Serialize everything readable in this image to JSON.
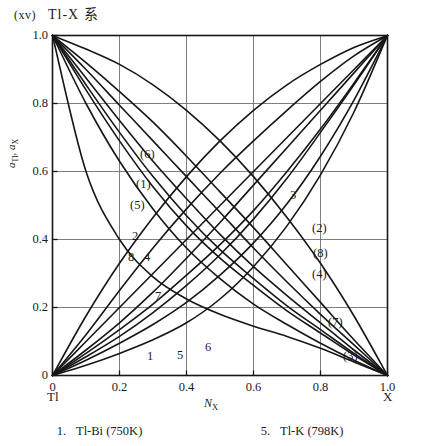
{
  "title": {
    "roman_numeral": "(xv)",
    "system": "Tl-X 系"
  },
  "axes": {
    "ylabel_main": "a",
    "ylabel_sub1": "Tl",
    "ylabel_sep": ", ",
    "ylabel_main2": "a",
    "ylabel_sub2": "X",
    "xlabel_main": "N",
    "xlabel_sub": "X",
    "endpoint_left": "Tl",
    "endpoint_right": "X",
    "ytick_labels": [
      "1.0",
      "0.8",
      "0.6",
      "0.4",
      "0.2",
      "0"
    ],
    "xtick_labels": [
      "0",
      "0.2",
      "0.4",
      "0.6",
      "0.8",
      "1.0"
    ]
  },
  "curve_labels": [
    {
      "text": "(6)",
      "x": 140,
      "y": 148
    },
    {
      "text": "(1)",
      "x": 136,
      "y": 178
    },
    {
      "text": "(5)",
      "x": 130,
      "y": 199
    },
    {
      "text": "2",
      "x": 132,
      "y": 230
    },
    {
      "text": "8",
      "x": 128,
      "y": 251
    },
    {
      "text": "4",
      "x": 144,
      "y": 251
    },
    {
      "text": "7",
      "x": 155,
      "y": 290
    },
    {
      "text": "1",
      "x": 147,
      "y": 350
    },
    {
      "text": "5",
      "x": 177,
      "y": 349
    },
    {
      "text": "6",
      "x": 205,
      "y": 341
    },
    {
      "text": "3",
      "x": 290,
      "y": 189
    },
    {
      "text": "(2)",
      "x": 312,
      "y": 222
    },
    {
      "text": "(8)",
      "x": 313,
      "y": 247
    },
    {
      "text": "(4)",
      "x": 312,
      "y": 268
    },
    {
      "text": "(7)",
      "x": 328,
      "y": 316
    },
    {
      "text": "(3)",
      "x": 343,
      "y": 350
    }
  ],
  "legend": [
    {
      "number": "1.",
      "label": "Tl-Bi (750K)"
    },
    {
      "number": "5.",
      "label": "Tl-K (798K)"
    }
  ],
  "colors": {
    "ink": "#1b1b1b",
    "grid": "#6b6b6b",
    "frame": "#1b1b1b",
    "background": "#ffffff"
  },
  "chart_data": {
    "type": "line",
    "title": "(xv) Tl-X 系",
    "xlabel": "N_X",
    "ylabel": "a_Tl, a_X",
    "xlim": [
      0,
      1
    ],
    "ylim": [
      0,
      1
    ],
    "xticks": [
      0,
      0.2,
      0.4,
      0.6,
      0.8,
      1.0
    ],
    "yticks": [
      0,
      0.2,
      0.4,
      0.6,
      0.8,
      1.0
    ],
    "grid": true,
    "legend_position": "below-plot",
    "x": [
      0,
      0.1,
      0.2,
      0.3,
      0.4,
      0.5,
      0.6,
      0.7,
      0.8,
      0.9,
      1.0
    ],
    "series": [
      {
        "name": "1",
        "component": "a_Tl",
        "system": "Tl-Bi (750K)",
        "values": [
          1.0,
          0.9,
          0.795,
          0.69,
          0.585,
          0.48,
          0.375,
          0.275,
          0.18,
          0.09,
          0.0
        ]
      },
      {
        "name": "(1)",
        "component": "a_X",
        "system": "Tl-Bi (750K)",
        "values": [
          0.0,
          0.075,
          0.155,
          0.245,
          0.345,
          0.45,
          0.56,
          0.67,
          0.78,
          0.89,
          1.0
        ]
      },
      {
        "name": "2",
        "component": "a_Tl",
        "values": [
          1.0,
          0.875,
          0.75,
          0.63,
          0.52,
          0.415,
          0.32,
          0.235,
          0.155,
          0.075,
          0.0
        ]
      },
      {
        "name": "(2)",
        "component": "a_X",
        "values": [
          0.0,
          0.1,
          0.2,
          0.3,
          0.4,
          0.5,
          0.6,
          0.7,
          0.8,
          0.9,
          1.0
        ]
      },
      {
        "name": "3",
        "component": "a_Tl",
        "values": [
          1.0,
          0.84,
          0.69,
          0.555,
          0.44,
          0.345,
          0.265,
          0.19,
          0.125,
          0.06,
          0.0
        ]
      },
      {
        "name": "(3)",
        "component": "a_X",
        "values": [
          0.0,
          0.03,
          0.065,
          0.105,
          0.155,
          0.225,
          0.32,
          0.44,
          0.59,
          0.775,
          1.0
        ]
      },
      {
        "name": "4",
        "component": "a_Tl",
        "values": [
          1.0,
          0.8,
          0.63,
          0.49,
          0.375,
          0.285,
          0.21,
          0.15,
          0.095,
          0.045,
          0.0
        ]
      },
      {
        "name": "(4)",
        "component": "a_X",
        "values": [
          0.0,
          0.045,
          0.095,
          0.15,
          0.215,
          0.295,
          0.39,
          0.505,
          0.645,
          0.81,
          1.0
        ]
      },
      {
        "name": "5",
        "component": "a_Tl",
        "system": "Tl-K (798K)",
        "values": [
          1.0,
          0.6,
          0.4,
          0.29,
          0.225,
          0.18,
          0.145,
          0.115,
          0.08,
          0.04,
          0.0
        ]
      },
      {
        "name": "(5)",
        "component": "a_X",
        "system": "Tl-K (798K)",
        "values": [
          0.0,
          0.12,
          0.25,
          0.375,
          0.49,
          0.595,
          0.69,
          0.78,
          0.865,
          0.94,
          1.0
        ]
      },
      {
        "name": "6",
        "component": "a_Tl",
        "values": [
          1.0,
          0.96,
          0.915,
          0.855,
          0.78,
          0.69,
          0.585,
          0.465,
          0.33,
          0.175,
          0.0
        ]
      },
      {
        "name": "(6)",
        "component": "a_X",
        "values": [
          0.0,
          0.175,
          0.33,
          0.465,
          0.585,
          0.69,
          0.78,
          0.855,
          0.915,
          0.965,
          1.0
        ]
      },
      {
        "name": "7",
        "component": "a_Tl",
        "values": [
          1.0,
          0.92,
          0.835,
          0.745,
          0.645,
          0.54,
          0.435,
          0.325,
          0.215,
          0.105,
          0.0
        ]
      },
      {
        "name": "(7)",
        "component": "a_X",
        "values": [
          0.0,
          0.055,
          0.115,
          0.185,
          0.265,
          0.355,
          0.46,
          0.58,
          0.715,
          0.855,
          1.0
        ]
      },
      {
        "name": "8",
        "component": "a_Tl",
        "values": [
          1.0,
          0.855,
          0.715,
          0.585,
          0.47,
          0.37,
          0.285,
          0.205,
          0.135,
          0.065,
          0.0
        ]
      },
      {
        "name": "(8)",
        "component": "a_X",
        "values": [
          0.0,
          0.065,
          0.135,
          0.21,
          0.295,
          0.385,
          0.485,
          0.6,
          0.725,
          0.86,
          1.0
        ]
      }
    ]
  }
}
